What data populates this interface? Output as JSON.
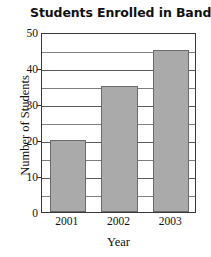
{
  "chart_data": {
    "type": "bar",
    "title": "Students Enrolled in Band",
    "xlabel": "Year",
    "ylabel": "Number of Students",
    "categories": [
      "2001",
      "2002",
      "2003"
    ],
    "values": [
      20,
      35,
      45
    ],
    "ylim": [
      0,
      50
    ],
    "y_major_ticks": [
      0,
      10,
      20,
      30,
      40,
      50
    ],
    "y_minor_ticks": [
      5,
      15,
      25,
      35,
      45
    ],
    "y_tick_labels": [
      "0",
      "10",
      "20",
      "30",
      "40",
      "50"
    ],
    "grid": true,
    "legend": "none",
    "bar_color": "#aaaaaa",
    "bar_border_color": "#6b6b6b",
    "axis_color": "#3a3a3a",
    "grid_color": "#7d7d7d",
    "background_color": "#ffffff"
  }
}
